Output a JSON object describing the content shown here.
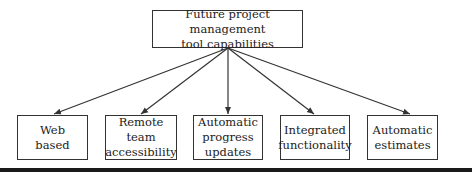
{
  "root": {
    "label": "Future project management tool capabilities",
    "line1": "Future project management",
    "line2": "tool capabilities"
  },
  "children": [
    {
      "line1": "Web",
      "line2": "based",
      "line3": ""
    },
    {
      "line1": "Remote team",
      "line2": "accessibility",
      "line3": ""
    },
    {
      "line1": "Automatic",
      "line2": "progress",
      "line3": "updates"
    },
    {
      "line1": "Integrated",
      "line2": "functionality",
      "line3": ""
    },
    {
      "line1": "Automatic",
      "line2": "estimates",
      "line3": ""
    }
  ],
  "colors": {
    "stroke": "#333333",
    "rule": "#1a1a1a"
  }
}
